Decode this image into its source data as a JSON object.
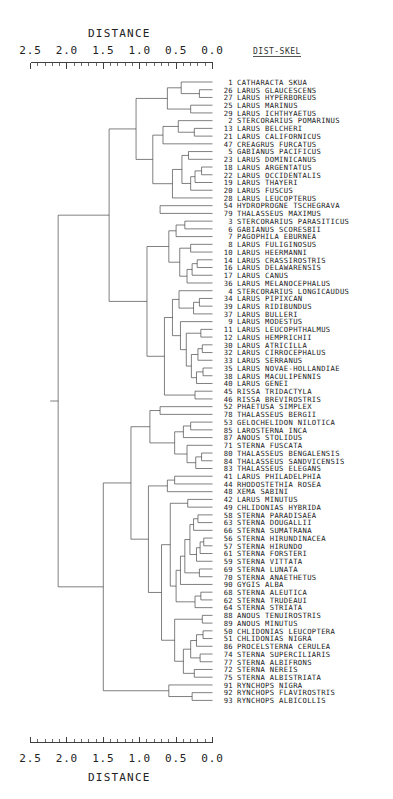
{
  "figure": {
    "type": "dendrogram",
    "axis_title_top": "DISTANCE",
    "axis_title_bottom": "DISTANCE",
    "corner_label": "DIST-SKEL",
    "tick_labels": [
      "2.5",
      "2.0",
      "1.5",
      "1.0",
      "0.5",
      "0.0"
    ],
    "tick_values": [
      2.5,
      2.0,
      1.5,
      1.0,
      0.5,
      0.0
    ],
    "axis_min": 0.0,
    "axis_max": 2.5,
    "axis_direction": "right-to-left",
    "minor_ticks_per_major": 5,
    "leaf_count": 93,
    "caption": ""
  },
  "leaves": [
    {
      "num": "1",
      "name": "CATHARACTA SKUA"
    },
    {
      "num": "26",
      "name": "LARUS GLAUCESCENS"
    },
    {
      "num": "27",
      "name": "LARUS HYPERBOREUS"
    },
    {
      "num": "25",
      "name": "LARUS MARINUS"
    },
    {
      "num": "29",
      "name": "LARUS ICHTHYAETUS"
    },
    {
      "num": "2",
      "name": "STERCORARIUS POMARINUS"
    },
    {
      "num": "13",
      "name": "LARUS BELCHERI"
    },
    {
      "num": "21",
      "name": "LARUS CALIFORNICUS"
    },
    {
      "num": "47",
      "name": "CREAGRUS FURCATUS"
    },
    {
      "num": "5",
      "name": "GABIANUS PACIFICUS"
    },
    {
      "num": "23",
      "name": "LARUS DOMINICANUS"
    },
    {
      "num": "18",
      "name": "LARUS ARGENTATUS"
    },
    {
      "num": "22",
      "name": "LARUS OCCIDENTALIS"
    },
    {
      "num": "19",
      "name": "LARUS THAYERI"
    },
    {
      "num": "20",
      "name": "LARUS FUSCUS"
    },
    {
      "num": "28",
      "name": "LARUS LEUCOPTERUS"
    },
    {
      "num": "54",
      "name": "HYDROPROGNE TSCHEGRAVA"
    },
    {
      "num": "79",
      "name": "THALASSEUS MAXIMUS"
    },
    {
      "num": "3",
      "name": "STERCORARIUS PARASITICUS"
    },
    {
      "num": "6",
      "name": "GABIANUS SCORESBII"
    },
    {
      "num": "7",
      "name": "PAGOPHILA EBURNEA"
    },
    {
      "num": "8",
      "name": "LARUS FULIGINOSUS"
    },
    {
      "num": "10",
      "name": "LARUS HEERMANNI"
    },
    {
      "num": "14",
      "name": "LARUS CRASSIROSTRIS"
    },
    {
      "num": "16",
      "name": "LARUS DELAWARENSIS"
    },
    {
      "num": "17",
      "name": "LARUS CANUS"
    },
    {
      "num": "36",
      "name": "LARUS MELANOCEPHALUS"
    },
    {
      "num": "4",
      "name": "STERCORARIUS LONGICAUDUS"
    },
    {
      "num": "34",
      "name": "LARUS PIPIXCAN"
    },
    {
      "num": "39",
      "name": "LARUS RIDIBUNDUS"
    },
    {
      "num": "37",
      "name": "LARUS BULLERI"
    },
    {
      "num": "9",
      "name": "LARUS MODESTUS"
    },
    {
      "num": "11",
      "name": "LARUS LEUCOPHTHALMUS"
    },
    {
      "num": "12",
      "name": "LARUS HEMPRICHII"
    },
    {
      "num": "30",
      "name": "LARUS ATRICILLA"
    },
    {
      "num": "32",
      "name": "LARUS CIRROCEPHALUS"
    },
    {
      "num": "33",
      "name": "LARUS SERRANUS"
    },
    {
      "num": "35",
      "name": "LARUS NOVAE-HOLLANDIAE"
    },
    {
      "num": "38",
      "name": "LARUS MACULIPENNIS"
    },
    {
      "num": "40",
      "name": "LARUS GENEI"
    },
    {
      "num": "45",
      "name": "RISSA TRIDACTYLA"
    },
    {
      "num": "46",
      "name": "RISSA BREVIROSTRIS"
    },
    {
      "num": "52",
      "name": "PHAETUSA SIMPLEX"
    },
    {
      "num": "78",
      "name": "THALASSEUS BERGII"
    },
    {
      "num": "53",
      "name": "GELOCHELIDON NILOTICA"
    },
    {
      "num": "85",
      "name": "LAROSTERNA INCA"
    },
    {
      "num": "87",
      "name": "ANOUS STOLIDUS"
    },
    {
      "num": "71",
      "name": "STERNA FUSCATA"
    },
    {
      "num": "80",
      "name": "THALASSEUS BENGALENSIS"
    },
    {
      "num": "84",
      "name": "THALASSEUS SANDVICENSIS"
    },
    {
      "num": "83",
      "name": "THALASSEUS ELEGANS"
    },
    {
      "num": "41",
      "name": "LARUS PHILADELPHIA"
    },
    {
      "num": "44",
      "name": "RHODOSTETHIA ROSEA"
    },
    {
      "num": "48",
      "name": "XEMA SABINI"
    },
    {
      "num": "42",
      "name": "LARUS MINUTUS"
    },
    {
      "num": "49",
      "name": "CHLIDONIAS HYBRIDA"
    },
    {
      "num": "58",
      "name": "STERNA PARADISAEA"
    },
    {
      "num": "63",
      "name": "STERNA DOUGALLII"
    },
    {
      "num": "66",
      "name": "STERNA SUMATRANA"
    },
    {
      "num": "56",
      "name": "STERNA HIRUNDINACEA"
    },
    {
      "num": "57",
      "name": "STERNA HIRUNDO"
    },
    {
      "num": "61",
      "name": "STERNA FORSTERI"
    },
    {
      "num": "59",
      "name": "STERNA VITTATA"
    },
    {
      "num": "69",
      "name": "STERNA LUNATA"
    },
    {
      "num": "70",
      "name": "STERNA ANAETHETUS"
    },
    {
      "num": "90",
      "name": "GYGIS ALBA"
    },
    {
      "num": "68",
      "name": "STERNA ALEUTICA"
    },
    {
      "num": "62",
      "name": "STERNA TRUDEAUI"
    },
    {
      "num": "64",
      "name": "STERNA STRIATA"
    },
    {
      "num": "88",
      "name": "ANOUS TENUIROSTRIS"
    },
    {
      "num": "89",
      "name": "ANOUS MINUTUS"
    },
    {
      "num": "50",
      "name": "CHLIDONIAS LEUCOPTERA"
    },
    {
      "num": "51",
      "name": "CHLIDONIAS NIGRA"
    },
    {
      "num": "86",
      "name": "PROCELSTERNA CERULEA"
    },
    {
      "num": "74",
      "name": "STERNA SUPERCILIARIS"
    },
    {
      "num": "77",
      "name": "STERNA ALBIFRONS"
    },
    {
      "num": "72",
      "name": "STERNA NEREIS"
    },
    {
      "num": "75",
      "name": "STERNA ALBISTRIATA"
    },
    {
      "num": "91",
      "name": "RYNCHOPS NIGRA"
    },
    {
      "num": "92",
      "name": "RYNCHOPS FLAVIROSTRIS"
    },
    {
      "num": "93",
      "name": "RYNCHOPS ALBICOLLIS"
    }
  ],
  "chart_data": {
    "type": "dendrogram",
    "title": "DISTANCE",
    "xlabel": "DISTANCE",
    "ylabel": "",
    "xlim": [
      2.5,
      0.0
    ],
    "grid": false,
    "legend": "none",
    "distance_metric": "DIST-SKEL",
    "leaf_order": [
      "1",
      "26",
      "27",
      "25",
      "29",
      "2",
      "13",
      "21",
      "47",
      "5",
      "23",
      "18",
      "22",
      "19",
      "20",
      "28",
      "54",
      "79",
      "3",
      "6",
      "7",
      "8",
      "10",
      "14",
      "16",
      "17",
      "36",
      "4",
      "34",
      "39",
      "37",
      "9",
      "11",
      "12",
      "30",
      "32",
      "33",
      "35",
      "38",
      "40",
      "45",
      "46",
      "52",
      "78",
      "53",
      "85",
      "87",
      "71",
      "80",
      "84",
      "83",
      "41",
      "44",
      "48",
      "42",
      "49",
      "58",
      "63",
      "66",
      "56",
      "57",
      "61",
      "59",
      "69",
      "70",
      "90",
      "68",
      "62",
      "64",
      "88",
      "89",
      "50",
      "51",
      "86",
      "74",
      "77",
      "72",
      "75",
      "91",
      "92",
      "93"
    ],
    "merges": [
      {
        "id": "m1",
        "left": "26",
        "right": "27",
        "height": 0.18
      },
      {
        "id": "m2",
        "left": "1",
        "right": "m1",
        "height": 0.43
      },
      {
        "id": "m3",
        "left": "25",
        "right": "29",
        "height": 0.3
      },
      {
        "id": "m4",
        "left": "m2",
        "right": "m3",
        "height": 0.62
      },
      {
        "id": "m5",
        "left": "13",
        "right": "21",
        "height": 0.25
      },
      {
        "id": "m6",
        "left": "2",
        "right": "m5",
        "height": 0.47
      },
      {
        "id": "m7",
        "left": "m6",
        "right": "47",
        "height": 0.68
      },
      {
        "id": "m8",
        "left": "5",
        "right": "23",
        "height": 0.33
      },
      {
        "id": "m9",
        "left": "18",
        "right": "22",
        "height": 0.15
      },
      {
        "id": "m10",
        "left": "m9",
        "right": "19",
        "height": 0.24
      },
      {
        "id": "m11",
        "left": "m10",
        "right": "20",
        "height": 0.3
      },
      {
        "id": "m12",
        "left": "m8",
        "right": "m11",
        "height": 0.42
      },
      {
        "id": "m13",
        "left": "m12",
        "right": "28",
        "height": 0.55
      },
      {
        "id": "m14",
        "left": "m7",
        "right": "m13",
        "height": 0.82
      },
      {
        "id": "m15",
        "left": "m4",
        "right": "m14",
        "height": 1.05
      },
      {
        "id": "m16",
        "left": "54",
        "right": "79",
        "height": 0.72
      },
      {
        "id": "m17",
        "left": "3",
        "right": "6",
        "height": 0.38
      },
      {
        "id": "m18",
        "left": "m17",
        "right": "7",
        "height": 0.5
      },
      {
        "id": "m19",
        "left": "8",
        "right": "10",
        "height": 0.3
      },
      {
        "id": "m20",
        "left": "14",
        "right": "16",
        "height": 0.21
      },
      {
        "id": "m21",
        "left": "m20",
        "right": "17",
        "height": 0.28
      },
      {
        "id": "m22",
        "left": "m21",
        "right": "36",
        "height": 0.35
      },
      {
        "id": "m23",
        "left": "m19",
        "right": "m22",
        "height": 0.45
      },
      {
        "id": "m24",
        "left": "m18",
        "right": "m23",
        "height": 0.6
      },
      {
        "id": "m25",
        "left": "34",
        "right": "39",
        "height": 0.18
      },
      {
        "id": "m26",
        "left": "m25",
        "right": "37",
        "height": 0.26
      },
      {
        "id": "m27",
        "left": "4",
        "right": "m26",
        "height": 0.46
      },
      {
        "id": "m28",
        "left": "11",
        "right": "12",
        "height": 0.16
      },
      {
        "id": "m29",
        "left": "30",
        "right": "32",
        "height": 0.14
      },
      {
        "id": "m30",
        "left": "m29",
        "right": "33",
        "height": 0.2
      },
      {
        "id": "m31",
        "left": "35",
        "right": "38",
        "height": 0.13
      },
      {
        "id": "m32",
        "left": "m31",
        "right": "40",
        "height": 0.22
      },
      {
        "id": "m33",
        "left": "m30",
        "right": "m32",
        "height": 0.29
      },
      {
        "id": "m34",
        "left": "m28",
        "right": "m33",
        "height": 0.36
      },
      {
        "id": "m35",
        "left": "9",
        "right": "m34",
        "height": 0.44
      },
      {
        "id": "m36",
        "left": "m27",
        "right": "m35",
        "height": 0.55
      },
      {
        "id": "m37",
        "left": "45",
        "right": "46",
        "height": 0.24
      },
      {
        "id": "m38",
        "left": "m36",
        "right": "m37",
        "height": 0.66
      },
      {
        "id": "m39",
        "left": "m24",
        "right": "m38",
        "height": 0.9
      },
      {
        "id": "m40",
        "left": "m15",
        "right": "m39",
        "height": 1.42
      },
      {
        "id": "m41",
        "left": "52",
        "right": "78",
        "height": 0.72
      },
      {
        "id": "m42",
        "left": "53",
        "right": "85",
        "height": 0.3
      },
      {
        "id": "m43",
        "left": "m42",
        "right": "87",
        "height": 0.4
      },
      {
        "id": "m44",
        "left": "80",
        "right": "84",
        "height": 0.15
      },
      {
        "id": "m45",
        "left": "m44",
        "right": "83",
        "height": 0.23
      },
      {
        "id": "m46",
        "left": "71",
        "right": "m45",
        "height": 0.35
      },
      {
        "id": "m47",
        "left": "m43",
        "right": "m46",
        "height": 0.52
      },
      {
        "id": "m48",
        "left": "m41",
        "right": "m47",
        "height": 0.86
      },
      {
        "id": "m49",
        "left": "41",
        "right": "44",
        "height": 0.52
      },
      {
        "id": "m50",
        "left": "m49",
        "right": "48",
        "height": 0.62
      },
      {
        "id": "m51",
        "left": "42",
        "right": "49",
        "height": 0.34
      },
      {
        "id": "m52",
        "left": "58",
        "right": "63",
        "height": 0.2
      },
      {
        "id": "m53",
        "left": "m52",
        "right": "66",
        "height": 0.26
      },
      {
        "id": "m54",
        "left": "56",
        "right": "57",
        "height": 0.12
      },
      {
        "id": "m55",
        "left": "m54",
        "right": "61",
        "height": 0.17
      },
      {
        "id": "m56",
        "left": "m55",
        "right": "59",
        "height": 0.22
      },
      {
        "id": "m57",
        "left": "m53",
        "right": "m56",
        "height": 0.31
      },
      {
        "id": "m58",
        "left": "69",
        "right": "70",
        "height": 0.18
      },
      {
        "id": "m59",
        "left": "m57",
        "right": "m58",
        "height": 0.38
      },
      {
        "id": "m60",
        "left": "m59",
        "right": "90",
        "height": 0.44
      },
      {
        "id": "m61",
        "left": "68",
        "right": "62",
        "height": 0.16
      },
      {
        "id": "m62",
        "left": "m61",
        "right": "64",
        "height": 0.24
      },
      {
        "id": "m63",
        "left": "m60",
        "right": "m62",
        "height": 0.5
      },
      {
        "id": "m64",
        "left": "m51",
        "right": "m63",
        "height": 0.58
      },
      {
        "id": "m65",
        "left": "88",
        "right": "89",
        "height": 0.14
      },
      {
        "id": "m66",
        "left": "50",
        "right": "51",
        "height": 0.13
      },
      {
        "id": "m67",
        "left": "m66",
        "right": "86",
        "height": 0.22
      },
      {
        "id": "m68",
        "left": "74",
        "right": "77",
        "height": 0.17
      },
      {
        "id": "m69",
        "left": "m67",
        "right": "m68",
        "height": 0.3
      },
      {
        "id": "m70",
        "left": "72",
        "right": "75",
        "height": 0.25
      },
      {
        "id": "m71",
        "left": "m69",
        "right": "m70",
        "height": 0.4
      },
      {
        "id": "m72",
        "left": "m65",
        "right": "m71",
        "height": 0.52
      },
      {
        "id": "m73",
        "left": "m64",
        "right": "m72",
        "height": 0.7
      },
      {
        "id": "m74",
        "left": "m50",
        "right": "m73",
        "height": 0.88
      },
      {
        "id": "m75",
        "left": "m48",
        "right": "m74",
        "height": 1.12
      },
      {
        "id": "m76",
        "left": "92",
        "right": "93",
        "height": 0.28
      },
      {
        "id": "m77",
        "left": "91",
        "right": "m76",
        "height": 0.6
      },
      {
        "id": "m78",
        "left": "m75",
        "right": "m77",
        "height": 1.5
      },
      {
        "id": "m79",
        "left": "m40",
        "right": "m78",
        "height": 2.12
      }
    ]
  }
}
